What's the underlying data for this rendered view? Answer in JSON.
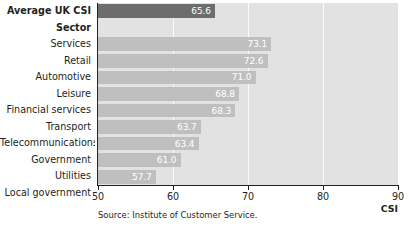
{
  "chart_data": {
    "type": "bar",
    "orientation": "horizontal",
    "title": "",
    "xlabel": "CSI",
    "ylabel": "",
    "xlim": [
      50,
      90
    ],
    "xticks": [
      50,
      60,
      70,
      80,
      90
    ],
    "grid": true,
    "legend": null,
    "source_note": "Source: Institute of Customer Service.",
    "categories": [
      "Average UK CSI",
      "Sector",
      "Services",
      "Retail",
      "Automotive",
      "Leisure",
      "Financial services",
      "Transport",
      "Telecommunications",
      "Government",
      "Utilities",
      "Local government"
    ],
    "rows": [
      {
        "label": "Average UK CSI",
        "value": 65.6,
        "value_text": "65.6",
        "bold": true,
        "highlight": true,
        "is_header": false
      },
      {
        "label": "Sector",
        "value": null,
        "value_text": "",
        "bold": true,
        "highlight": false,
        "is_header": true
      },
      {
        "label": "Services",
        "value": 73.1,
        "value_text": "73.1",
        "bold": false,
        "highlight": false,
        "is_header": false
      },
      {
        "label": "Retail",
        "value": 72.6,
        "value_text": "72.6",
        "bold": false,
        "highlight": false,
        "is_header": false
      },
      {
        "label": "Automotive",
        "value": 71.0,
        "value_text": "71.0",
        "bold": false,
        "highlight": false,
        "is_header": false
      },
      {
        "label": "Leisure",
        "value": 68.8,
        "value_text": "68.8",
        "bold": false,
        "highlight": false,
        "is_header": false
      },
      {
        "label": "Financial services",
        "value": 68.3,
        "value_text": "68.3",
        "bold": false,
        "highlight": false,
        "is_header": false
      },
      {
        "label": "Transport",
        "value": 63.7,
        "value_text": "63.7",
        "bold": false,
        "highlight": false,
        "is_header": false
      },
      {
        "label": "Telecommunications",
        "value": 63.4,
        "value_text": "63.4",
        "bold": false,
        "highlight": false,
        "is_header": false
      },
      {
        "label": "Government",
        "value": 61.0,
        "value_text": "61.0",
        "bold": false,
        "highlight": false,
        "is_header": false
      },
      {
        "label": "Utilities",
        "value": 57.7,
        "value_text": "57.7",
        "bold": false,
        "highlight": false,
        "is_header": false
      },
      {
        "label": "Local government",
        "value": 55.5,
        "value_text": "55.5",
        "bold": false,
        "highlight": false,
        "is_header": false
      }
    ],
    "values": [
      65.6,
      null,
      73.1,
      72.6,
      71.0,
      68.8,
      68.3,
      63.7,
      63.4,
      61.0,
      57.7,
      55.5
    ]
  },
  "colors": {
    "bar": "#bfbfbf",
    "bar_highlight": "#6d6d6d",
    "plot_background": "#e2e2e2",
    "gridline": "#fbfbfb",
    "axis": "#231f20",
    "value_label": "#ffffff",
    "text": "#231f20"
  }
}
